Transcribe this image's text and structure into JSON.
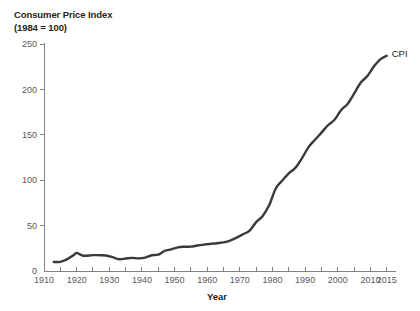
{
  "title": {
    "line1": "Consumer Price Index",
    "line2": "(1984 = 100)"
  },
  "colors": {
    "series_line": "#3a3a3a",
    "axis": "#808285",
    "text": "#231f20",
    "tick_text": "#58595b",
    "background": "#ffffff"
  },
  "chart_data": {
    "type": "line",
    "title": "Consumer Price Index (1984 = 100)",
    "xlabel": "Year",
    "ylabel": "",
    "xlim": [
      1910,
      2016
    ],
    "ylim": [
      0,
      260
    ],
    "grid": false,
    "legend_position": "end-of-line",
    "yticks": [
      0,
      50,
      100,
      150,
      200,
      250
    ],
    "ytick_labels": [
      "0",
      "50",
      "100",
      "150",
      "200",
      "250"
    ],
    "xticks": [
      1910,
      1920,
      1930,
      1940,
      1950,
      1960,
      1970,
      1980,
      1990,
      2000,
      2010,
      2015
    ],
    "xtick_labels": [
      "1910",
      "1920",
      "1930",
      "1940",
      "1950",
      "1960",
      "1970",
      "1980",
      "1990",
      "2000",
      "2010",
      "2015"
    ],
    "xminor_step": 5,
    "series": [
      {
        "name": "CPI",
        "label": "CPI",
        "x": [
          1913,
          1915,
          1917,
          1919,
          1920,
          1922,
          1925,
          1927,
          1929,
          1931,
          1933,
          1935,
          1937,
          1939,
          1941,
          1943,
          1945,
          1947,
          1949,
          1951,
          1953,
          1955,
          1957,
          1959,
          1961,
          1963,
          1965,
          1967,
          1969,
          1971,
          1973,
          1975,
          1977,
          1979,
          1981,
          1983,
          1985,
          1987,
          1989,
          1991,
          1993,
          1995,
          1997,
          1999,
          2001,
          2003,
          2005,
          2007,
          2009,
          2011,
          2013,
          2015
        ],
        "values": [
          9.9,
          10.1,
          12.8,
          17.3,
          20.0,
          16.8,
          17.5,
          17.4,
          17.1,
          15.2,
          13.0,
          13.7,
          14.4,
          13.9,
          14.7,
          17.3,
          18.0,
          22.3,
          23.8,
          26.0,
          26.7,
          26.8,
          28.1,
          29.1,
          29.9,
          30.6,
          31.5,
          33.4,
          36.7,
          40.5,
          44.4,
          53.8,
          60.6,
          72.6,
          90.9,
          99.6,
          107.6,
          113.6,
          124.0,
          136.2,
          144.5,
          152.4,
          160.5,
          166.6,
          177.1,
          184.0,
          195.3,
          207.3,
          214.5,
          224.9,
          233.0,
          237.0
        ]
      }
    ]
  },
  "axis": {
    "x_title": "Year"
  }
}
